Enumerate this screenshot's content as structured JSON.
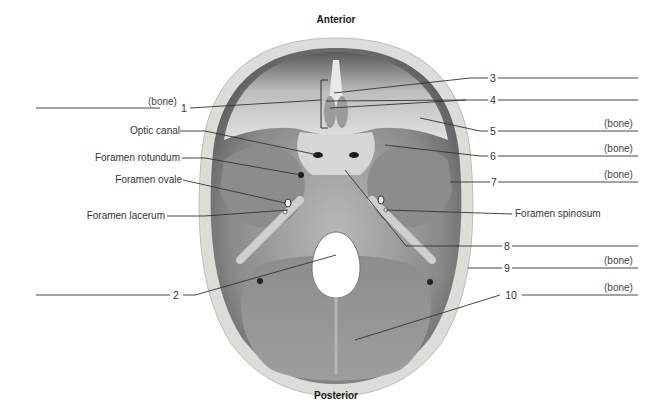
{
  "figure": {
    "title_top": "Anterior",
    "title_bottom": "Posterior",
    "view": "Superior view of cranial floor (base of skull interior)"
  },
  "numbered_labels": [
    {
      "number": "1",
      "suffix": "(bone)",
      "side": "left"
    },
    {
      "number": "2",
      "suffix": "",
      "side": "left"
    },
    {
      "number": "3",
      "suffix": "",
      "side": "right"
    },
    {
      "number": "4",
      "suffix": "",
      "side": "right"
    },
    {
      "number": "5",
      "suffix": "(bone)",
      "side": "right"
    },
    {
      "number": "6",
      "suffix": "(bone)",
      "side": "right"
    },
    {
      "number": "7",
      "suffix": "(bone)",
      "side": "right"
    },
    {
      "number": "8",
      "suffix": "",
      "side": "right"
    },
    {
      "number": "9",
      "suffix": "(bone)",
      "side": "right"
    },
    {
      "number": "10",
      "suffix": "(bone)",
      "side": "right"
    }
  ],
  "named_labels": [
    {
      "text": "Optic canal",
      "side": "left"
    },
    {
      "text": "Foramen rotundum",
      "side": "left"
    },
    {
      "text": "Foramen ovale",
      "side": "left"
    },
    {
      "text": "Foramen lacerum",
      "side": "left"
    },
    {
      "text": "Foramen spinosum",
      "side": "right"
    }
  ],
  "colors": {
    "background": "#ffffff",
    "leader_line": "#333333",
    "bone_rim": "#d9d9d6",
    "fossa_dark": "#6e6e6e",
    "fossa_light": "#d2d2d2"
  }
}
